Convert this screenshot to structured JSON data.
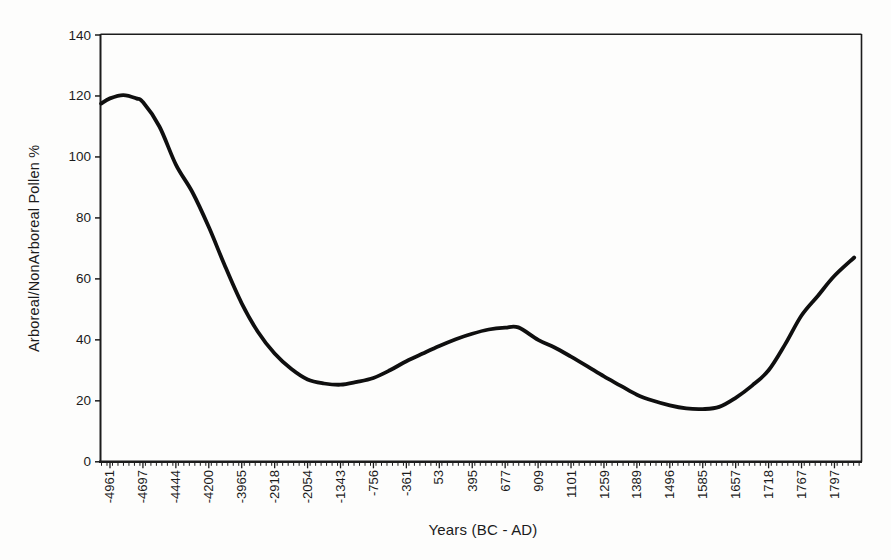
{
  "figure": {
    "background": "#fdfdfc",
    "frame_color": "#1c1c1c",
    "curve_color": "#0f0f0f",
    "tick_color": "#1c1c1c"
  },
  "chart_data": {
    "type": "line",
    "title": "",
    "xlabel": "Years (BC - AD)",
    "ylabel": "Arboreal/NonArboreal Pollen %",
    "x_axis_kind": "category",
    "categories": [
      "-4961",
      "-4697",
      "-4444",
      "-4200",
      "-3965",
      "-2918",
      "-2054",
      "-1343",
      "-756",
      "-361",
      "53",
      "395",
      "677",
      "909",
      "1101",
      "1259",
      "1389",
      "1496",
      "1585",
      "1657",
      "1718",
      "1767",
      "1797"
    ],
    "values": [
      119,
      118,
      97.5,
      77,
      52,
      35.5,
      27,
      25.3,
      27.5,
      33,
      38,
      42,
      44,
      40,
      34.5,
      28,
      22,
      18.5,
      17.3,
      21,
      30,
      48,
      61
    ],
    "ylim": [
      0,
      140
    ],
    "yticks": [
      0,
      20,
      40,
      60,
      80,
      100,
      120,
      140
    ],
    "grid": "off",
    "legend": "none",
    "line_width": 3.8,
    "curve_path": [
      [
        -0.27,
        117.5
      ],
      [
        0,
        119.2
      ],
      [
        0.4,
        120.3
      ],
      [
        0.8,
        119.2
      ],
      [
        1,
        118
      ],
      [
        1.5,
        110
      ],
      [
        2,
        97.5
      ],
      [
        2.5,
        88.5
      ],
      [
        3,
        77
      ],
      [
        3.5,
        64
      ],
      [
        4,
        52
      ],
      [
        4.5,
        42.5
      ],
      [
        5,
        35.5
      ],
      [
        5.5,
        30.5
      ],
      [
        6,
        27
      ],
      [
        6.5,
        25.7
      ],
      [
        7,
        25.3
      ],
      [
        7.5,
        26.2
      ],
      [
        8,
        27.5
      ],
      [
        8.5,
        30
      ],
      [
        9,
        33
      ],
      [
        9.5,
        35.5
      ],
      [
        10,
        38
      ],
      [
        10.5,
        40.2
      ],
      [
        11,
        42
      ],
      [
        11.5,
        43.4
      ],
      [
        12,
        44
      ],
      [
        12.4,
        44.1
      ],
      [
        13,
        40
      ],
      [
        13.5,
        37.5
      ],
      [
        14,
        34.5
      ],
      [
        14.5,
        31.3
      ],
      [
        15,
        28
      ],
      [
        15.5,
        25
      ],
      [
        16,
        22
      ],
      [
        16.5,
        20
      ],
      [
        17,
        18.5
      ],
      [
        17.5,
        17.5
      ],
      [
        18,
        17.3
      ],
      [
        18.5,
        18
      ],
      [
        19,
        21
      ],
      [
        19.5,
        25
      ],
      [
        20,
        30
      ],
      [
        20.5,
        38.5
      ],
      [
        21,
        48
      ],
      [
        21.5,
        54.5
      ],
      [
        22,
        61
      ],
      [
        22.6,
        67
      ]
    ],
    "layout": {
      "plot_left": 100.5,
      "plot_right": 861.5,
      "plot_top": 35,
      "plot_bottom": 461.8,
      "first_tick_x": 110,
      "tick_spacing": 32.93,
      "minor_tick_step": 5.49
    }
  }
}
